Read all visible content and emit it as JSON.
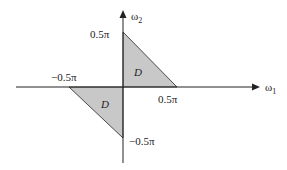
{
  "diagram": {
    "type": "frequency-domain region diagram",
    "axes": {
      "horizontal": {
        "label": "ω",
        "subscript": "1"
      },
      "vertical": {
        "label": "ω",
        "subscript": "2"
      }
    },
    "tick_labels": {
      "pos_w2": "0.5π",
      "neg_w2": "−0.5π",
      "pos_w1": "0.5π",
      "neg_w1": "−0.5π"
    },
    "regions": [
      {
        "name": "upper-right-triangle",
        "label": "D",
        "vertices": [
          [
            0,
            0.5
          ],
          [
            0,
            0
          ],
          [
            0.5,
            0
          ]
        ]
      },
      {
        "name": "lower-left-triangle",
        "label": "D",
        "vertices": [
          [
            -0.5,
            0
          ],
          [
            0,
            0
          ],
          [
            0,
            -0.5
          ]
        ]
      }
    ],
    "colors": {
      "fill": "#c8c8c8",
      "stroke": "#222222"
    }
  }
}
